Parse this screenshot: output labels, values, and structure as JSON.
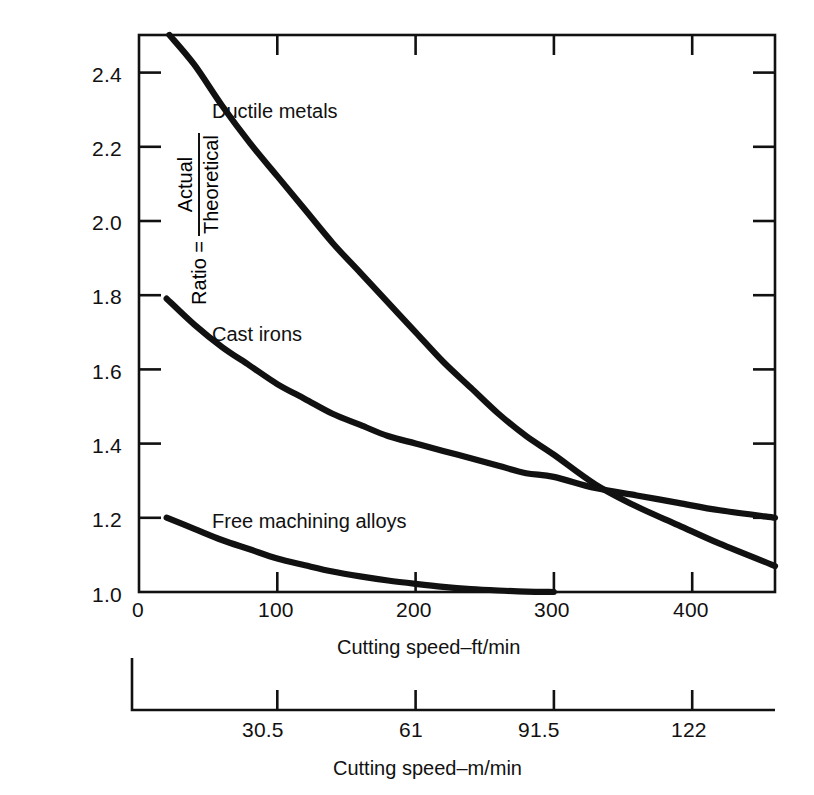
{
  "chart_data": {
    "type": "line",
    "title": "",
    "xlabel": "Cutting speed–ft/min",
    "xlabel_secondary": "Cutting speed–m/min",
    "ylabel_prefix": "Ratio =",
    "ylabel_numerator": "Actual",
    "ylabel_denominator": "Theoretical",
    "xlim": [
      0,
      460
    ],
    "ylim": [
      1.0,
      2.5
    ],
    "grid": false,
    "legend": "inline-curve-labels",
    "xticks": [
      0,
      100,
      200,
      300,
      400
    ],
    "xtick_labels": [
      "0",
      "100",
      "200",
      "300",
      "400"
    ],
    "xticks_secondary": [
      30.5,
      61,
      91.5,
      122
    ],
    "xtick_labels_secondary": [
      "30.5",
      "61",
      "91.5",
      "122"
    ],
    "yticks": [
      1.0,
      1.2,
      1.4,
      1.6,
      1.8,
      2.0,
      2.2,
      2.4
    ],
    "ytick_labels": [
      "1.0",
      "1.2",
      "1.4",
      "1.6",
      "1.8",
      "2.0",
      "2.2",
      "2.4"
    ],
    "series": [
      {
        "name": "Ductile metals",
        "label": "Ductile metals",
        "color": "#111111",
        "x": [
          22,
          40,
          60,
          80,
          100,
          120,
          140,
          160,
          180,
          200,
          220,
          240,
          260,
          280,
          300,
          330,
          360,
          390,
          420,
          460
        ],
        "y": [
          2.5,
          2.42,
          2.31,
          2.21,
          2.12,
          2.03,
          1.94,
          1.86,
          1.78,
          1.7,
          1.62,
          1.55,
          1.48,
          1.42,
          1.37,
          1.29,
          1.23,
          1.18,
          1.13,
          1.07
        ]
      },
      {
        "name": "Cast irons",
        "label": "Cast irons",
        "color": "#111111",
        "x": [
          20,
          40,
          60,
          80,
          100,
          120,
          140,
          160,
          180,
          200,
          220,
          240,
          260,
          280,
          300,
          330,
          360,
          390,
          420,
          460
        ],
        "y": [
          1.79,
          1.72,
          1.66,
          1.61,
          1.56,
          1.52,
          1.48,
          1.45,
          1.42,
          1.4,
          1.38,
          1.36,
          1.34,
          1.32,
          1.31,
          1.28,
          1.26,
          1.24,
          1.22,
          1.2
        ]
      },
      {
        "name": "Free machining alloys",
        "label": "Free machining alloys",
        "color": "#111111",
        "x": [
          20,
          40,
          60,
          80,
          100,
          120,
          140,
          160,
          180,
          200,
          220,
          240,
          260,
          280,
          300
        ],
        "y": [
          1.2,
          1.17,
          1.14,
          1.115,
          1.09,
          1.072,
          1.055,
          1.042,
          1.031,
          1.022,
          1.014,
          1.008,
          1.004,
          1.001,
          1.0
        ]
      }
    ],
    "annotations": [
      {
        "text": "Ductile metals",
        "x_px": 212,
        "y_px": 100
      },
      {
        "text": "Cast irons",
        "x_px": 212,
        "y_px": 323
      },
      {
        "text": "Free machining alloys",
        "x_px": 212,
        "y_px": 510
      }
    ]
  },
  "colors": {
    "axis": "#111111",
    "curve": "#111111",
    "background": "#ffffff",
    "text": "#111111"
  }
}
